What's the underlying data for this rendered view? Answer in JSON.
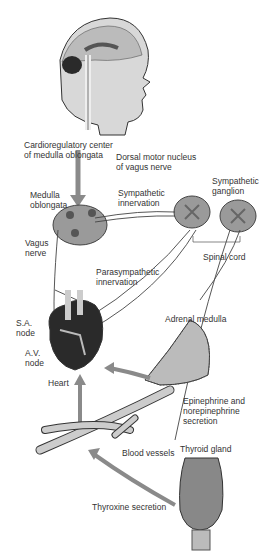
{
  "diagram": {
    "topic": "Neural and hormonal control of heart rate",
    "labels": {
      "cardioregulatory": "Cardioregulatory center\nof medulla oblongata",
      "dorsal_motor": "Dorsal motor nucleus\nof vagus nerve",
      "medulla": "Medulla\noblongata",
      "sympathetic_innervation": "Sympathetic\ninnervation",
      "sympathetic_ganglion": "Sympathetic\nganglion",
      "vagus_nerve": "Vagus\nnerve",
      "spinal_cord": "Spinal cord",
      "parasympathetic": "Parasympathetic\ninnervation",
      "sa_node": "S.A.\nnode",
      "av_node": "A.V.\nnode",
      "heart": "Heart",
      "adrenal_medulla": "Adrenal medulla",
      "epinephrine": "Epinephrine and\nnorepinephrine\nsecretion",
      "blood_vessels": "Blood vessels",
      "thyroid_gland": "Thyroid gland",
      "thyroxine": "Thyroxine secretion"
    },
    "colors": {
      "arrow": "#8a8a8a",
      "tissue": "#9a9a9a",
      "dark": "#2a2a2a",
      "line": "#444444"
    }
  }
}
